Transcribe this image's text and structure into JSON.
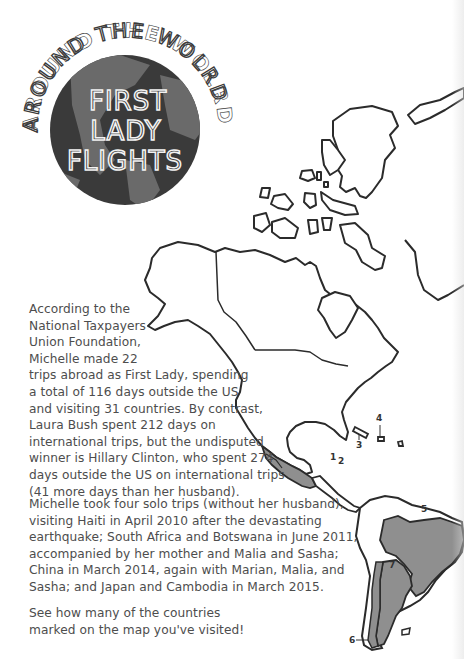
{
  "badge": {
    "arc_title": "AROUND THE WOLRD",
    "title_lines": [
      "FIRST",
      "LADY",
      "FLIGHTS"
    ],
    "globe_colors": {
      "ocean": "#3a3a3a",
      "land": "#6a6a6a"
    }
  },
  "body": {
    "paragraph_1_lines": [
      "According to the",
      "National Taxpayers",
      "Union Foundation,",
      "Michelle made 22",
      "trips abroad as First Lady, spending",
      "a total of 116 days outside the US",
      "and visiting 31 countries. By contrast,",
      "Laura Bush spent 212 days on",
      "international trips, but the undisputed",
      "winner is Hillary Clinton, who spent 274",
      "days outside the US on international trips",
      "(41 more days than her husband)."
    ],
    "paragraph_2_lines": [
      "Michelle took four solo trips (without her husband),",
      "visiting Haiti in April 2010 after the devastating",
      "earthquake; South Africa and Botswana in June 2011,",
      "accompanied by her mother and Malia and Sasha;",
      "China in March 2014, again with Marian, Malia, and",
      "Sasha; and Japan and Cambodia in March 2015."
    ],
    "paragraph_3_lines": [
      "See how many of the countries",
      "marked on the map  you've visited!"
    ]
  },
  "map": {
    "labels": [
      {
        "id": "1",
        "text": "1"
      },
      {
        "id": "2",
        "text": "2"
      },
      {
        "id": "3",
        "text": "3"
      },
      {
        "id": "4",
        "text": "4"
      },
      {
        "id": "5",
        "text": "5"
      },
      {
        "id": "6",
        "text": "6"
      },
      {
        "id": "7",
        "text": "7"
      }
    ],
    "colors": {
      "outline": "#2b2b2b",
      "highlight": "#8f8f8f",
      "land": "#ffffff"
    }
  }
}
